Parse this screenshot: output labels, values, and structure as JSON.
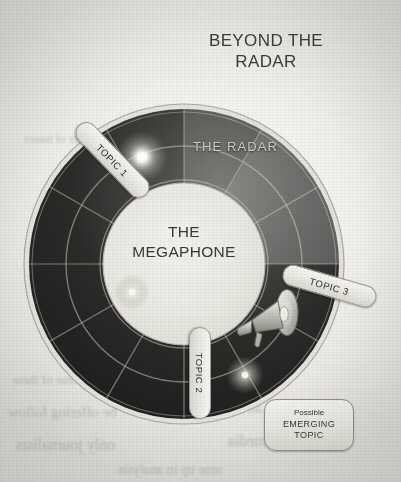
{
  "page": {
    "kind": "scanned-book-figure",
    "background_color": "#f3f2f0",
    "paper_tint": "#e6e5e1"
  },
  "title": {
    "line1": "BEYOND THE",
    "line2": "RADAR"
  },
  "radar": {
    "outer_ring_label": "THE RADAR",
    "ring_color": "#262525",
    "ring_sweep_color": "#5d5c59",
    "grid_color": "#b9b7b0",
    "rim_color": "#cfcdc6",
    "band_count": 2,
    "spoke_count": 12,
    "center_label_line1": "THE",
    "center_label_line2": "MEGAPHONE",
    "center_fill": "#e9e8e3",
    "icon": "megaphone-icon"
  },
  "blips": [
    {
      "name": "blip-topic-1",
      "x": 121,
      "y": 56,
      "size": 46,
      "intensity": "bright"
    },
    {
      "name": "blip-left",
      "x": 111,
      "y": 191,
      "size": 30,
      "intensity": "medium"
    },
    {
      "name": "blip-bottom",
      "x": 224,
      "y": 274,
      "size": 34,
      "intensity": "medium"
    }
  ],
  "topics": [
    {
      "label": "TOPIC 1",
      "angle_deg": 46
    },
    {
      "label": "TOPIC 2",
      "angle_deg": 90
    },
    {
      "label": "TOPIC 3",
      "angle_deg": 16
    }
  ],
  "legend": {
    "line1": "Possible",
    "line2": "EMERGING",
    "line3": "TOPIC"
  },
  "bleed_through": [
    {
      "text": "the outcome of these",
      "x": 12,
      "y": 372,
      "size": 13
    },
    {
      "text": "is one of the only",
      "x": 196,
      "y": 366,
      "size": 13
    },
    {
      "text": "be offering follow",
      "x": 8,
      "y": 404,
      "size": 15
    },
    {
      "text": "rning of an issue",
      "x": 214,
      "y": 400,
      "size": 15
    },
    {
      "text": "only journalists",
      "x": 16,
      "y": 436,
      "size": 16
    },
    {
      "text": "in the media",
      "x": 228,
      "y": 432,
      "size": 16
    },
    {
      "text": "ome up in analysis",
      "x": 118,
      "y": 462,
      "size": 14
    },
    {
      "text": "a number of issues",
      "x": 24,
      "y": 132,
      "size": 12
    },
    {
      "text": "their reporting",
      "x": 262,
      "y": 300,
      "size": 12
    }
  ]
}
